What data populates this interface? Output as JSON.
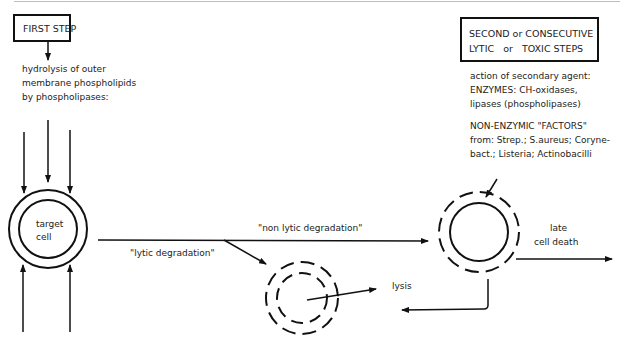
{
  "first_step": {
    "box_label": "FIRST STEP",
    "description": [
      "hydrolysis of outer",
      "membrane phospholipids",
      "by phospholipases:"
    ]
  },
  "second_step": {
    "box_lines": [
      "SECOND or CONSECUTIVE",
      "LYTIC   or   TOXIC STEPS"
    ],
    "enzymes": [
      "action of secondary agent:",
      "ENZYMES: CH-oxidases,",
      "lipases (phospholipases)"
    ],
    "non_enzymic": [
      "NON-ENZYMIC \"FACTORS\"",
      "from: Strep.; S.aureus; Coryne-",
      "bact.; Listeria; Actinobacilli"
    ]
  },
  "target_cell": {
    "label_line1": "target",
    "label_line2": "cell"
  },
  "paths": {
    "non_lytic": "\"non lytic degradation\"",
    "lytic": "\"lytic degradation\"",
    "lysis": "lysis",
    "late_death_line1": "late",
    "late_death_line2": "cell death"
  },
  "colors": {
    "stroke": "#111111",
    "text": "#222222",
    "background": "#ffffff"
  }
}
